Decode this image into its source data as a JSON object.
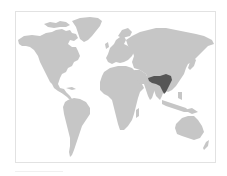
{
  "map": {
    "type": "world-distribution-map",
    "projection": "simplified world outline",
    "colors": {
      "background": "#ffffff",
      "frame_border": "#e2e2e2",
      "land": "#c6c6c6",
      "highlighted_range": "#565656"
    },
    "highlighted_region": {
      "label": "Highlighted range",
      "approximate_area": "Northeast India, Bangladesh, Myanmar, southern China"
    },
    "continents": [
      "North America",
      "Greenland",
      "South America",
      "Europe",
      "Africa",
      "Asia",
      "Australia"
    ]
  }
}
